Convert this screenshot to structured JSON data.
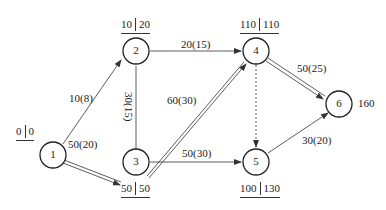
{
  "nodes": [
    {
      "id": "1",
      "label": "1",
      "times": {
        "early": "0",
        "late": "0"
      }
    },
    {
      "id": "2",
      "label": "2",
      "times": {
        "early": "10",
        "late": "20"
      }
    },
    {
      "id": "3",
      "label": "3",
      "times": {
        "early": "50",
        "late": "50"
      }
    },
    {
      "id": "4",
      "label": "4",
      "times": {
        "early": "110",
        "late": "110"
      }
    },
    {
      "id": "5",
      "label": "5",
      "times": {
        "early": "100",
        "late": "130"
      }
    },
    {
      "id": "6",
      "label": "6",
      "total": "160"
    }
  ],
  "edges": [
    {
      "from": "1",
      "to": "2",
      "label": "10(8)",
      "critical": false
    },
    {
      "from": "1",
      "to": "3",
      "label": "50(20)",
      "critical": true
    },
    {
      "from": "2",
      "to": "3",
      "label": "30(15)",
      "critical": false
    },
    {
      "from": "2",
      "to": "4",
      "label": "20(15)",
      "critical": false
    },
    {
      "from": "3",
      "to": "4",
      "label": "60(30)",
      "critical": true
    },
    {
      "from": "3",
      "to": "5",
      "label": "50(30)",
      "critical": false
    },
    {
      "from": "4",
      "to": "5",
      "label": "",
      "critical": false,
      "dummy": true
    },
    {
      "from": "4",
      "to": "6",
      "label": "50(25)",
      "critical": true
    },
    {
      "from": "5",
      "to": "6",
      "label": "30(20)",
      "critical": false
    }
  ],
  "colors": {
    "line": "#333333",
    "background": "#ffffff"
  }
}
